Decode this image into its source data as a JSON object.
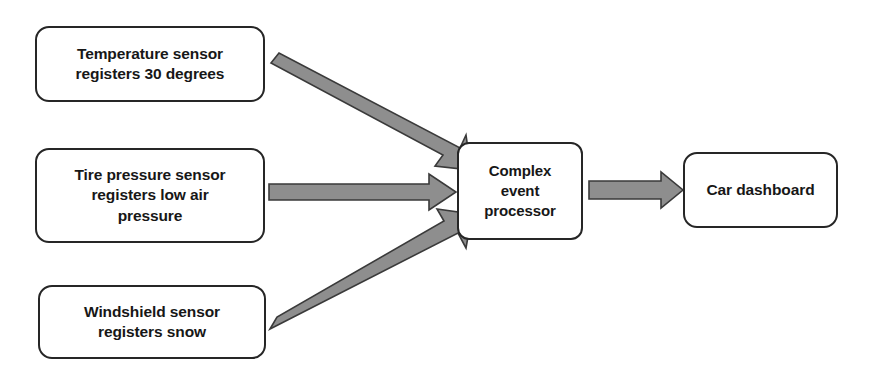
{
  "diagram": {
    "background_color": "#ffffff",
    "node_border_color": "#262626",
    "node_fill_color": "#ffffff",
    "arrow_fill_color": "#8e8e8e",
    "arrow_stroke_color": "#3a3a3a",
    "text_color": "#171717",
    "nodes": [
      {
        "id": "temperature",
        "label": "Temperature sensor\nregisters 30 degrees"
      },
      {
        "id": "tire",
        "label": "Tire pressure sensor\nregisters low air\npressure"
      },
      {
        "id": "windshield",
        "label": "Windshield sensor\nregisters snow"
      },
      {
        "id": "cep",
        "label": "Complex\nevent\nprocessor"
      },
      {
        "id": "dashboard",
        "label": "Car dashboard"
      }
    ],
    "edges": [
      {
        "id": "temperature-to-cep",
        "from": "temperature",
        "to": "cep",
        "style": "diagonal-down-right"
      },
      {
        "id": "tire-to-cep",
        "from": "tire",
        "to": "cep",
        "style": "horizontal-right"
      },
      {
        "id": "windshield-to-cep",
        "from": "windshield",
        "to": "cep",
        "style": "diagonal-up-right"
      },
      {
        "id": "cep-to-dashboard",
        "from": "cep",
        "to": "dashboard",
        "style": "horizontal-right"
      }
    ]
  }
}
